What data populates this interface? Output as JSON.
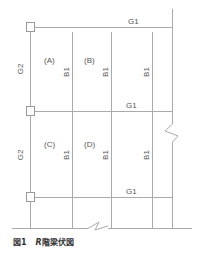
{
  "diagram": {
    "beam_labels": {
      "top_g1": "G1",
      "mid_g1": "G1",
      "bot_g1": "G1",
      "g2_upper": "G2",
      "g2_lower": "G2",
      "b1_upper_1": "B1",
      "b1_upper_2": "B1",
      "b1_upper_3": "B1",
      "b1_lower_1": "B1",
      "b1_lower_2": "B1",
      "b1_lower_3": "B1"
    },
    "panel_labels": {
      "a": "(A)",
      "b": "(B)",
      "c": "(C)",
      "d": "(D)"
    },
    "line_color": "#aaaaaa"
  },
  "caption": {
    "figure_number": "図1",
    "floor": "R",
    "title": "階梁伏図"
  }
}
